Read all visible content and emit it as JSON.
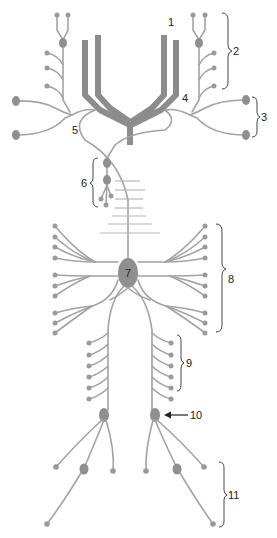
{
  "diagram": {
    "title": "",
    "labels": [
      {
        "id": "1",
        "text": "1"
      },
      {
        "id": "2",
        "text": "2"
      },
      {
        "id": "3",
        "text": "3"
      },
      {
        "id": "4",
        "text": "4"
      },
      {
        "id": "5",
        "text": "5"
      },
      {
        "id": "6",
        "text": "6"
      },
      {
        "id": "7",
        "text": "7"
      },
      {
        "id": "8",
        "text": "8"
      },
      {
        "id": "9",
        "text": "9"
      },
      {
        "id": "10",
        "text": "10"
      },
      {
        "id": "11",
        "text": "11"
      }
    ],
    "colors": {
      "nerve": "#a3a3a3",
      "trunk": "#8c8c8c",
      "ganglion": "#8f8f8f",
      "label": "#222222",
      "background": "#ffffff"
    }
  }
}
